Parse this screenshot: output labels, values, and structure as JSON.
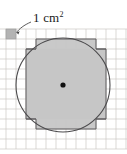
{
  "figure": {
    "annotation": {
      "label_value": "1 cm",
      "label_exponent": "2",
      "label_full": "1 cm²",
      "leader_from": [
        32,
        22
      ],
      "leader_to": [
        16,
        33
      ],
      "points_to": "highlighted-unit-square"
    },
    "colors": {
      "background": "#ffffff",
      "grid_line": "#c9c6c2",
      "grid_line_major": "#b6b2ae",
      "shape_outline": "#59585a",
      "circle_outline": "#4c4b4d",
      "fill_shaded": "#c6c6c6",
      "fill_highlight": "#b0b0b0",
      "center_dot": "#111111",
      "text": "#1a1a1a"
    },
    "grid": {
      "cell_size_px": 10,
      "origin_x": 6,
      "origin_y": 29,
      "columns": 12,
      "rows": 12,
      "unit_label": "1 cm"
    },
    "circle": {
      "center_x": 63,
      "center_y": 85,
      "radius_px": 47,
      "radius_units": 4.7,
      "stroke_width": 1
    },
    "center_point": {
      "x": 63,
      "y": 85,
      "radius": 2.6,
      "name": "circle-centre"
    },
    "shaded_region": {
      "description": "Stepped unit-square region approximating the circle area",
      "cells_per_half_row": [
        3,
        4,
        5,
        5,
        5,
        5,
        5,
        5,
        4,
        3
      ]
    },
    "octagon_outline": {
      "description": "Stepped polygon following unit-square boundary around circle",
      "stroke_width": 1
    },
    "highlight_square": {
      "x": 6,
      "y": 29,
      "size": 10,
      "name": "one-square-centimetre"
    }
  }
}
